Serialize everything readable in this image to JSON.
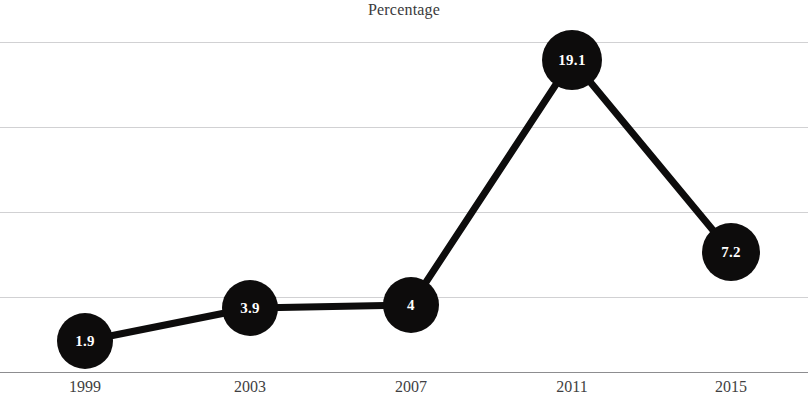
{
  "chart_data": {
    "type": "line",
    "title": "Percentage",
    "xlabel": "",
    "ylabel": "",
    "categories": [
      "1999",
      "2003",
      "2007",
      "2011",
      "2015"
    ],
    "values": [
      1.9,
      3.9,
      4,
      19.1,
      7.2
    ],
    "point_labels": [
      "1.9",
      "3.9",
      "4",
      "19.1",
      "7.2"
    ],
    "series": [
      {
        "name": "Percentage",
        "values": [
          1.9,
          3.9,
          4,
          19.1,
          7.2
        ]
      }
    ],
    "ylim": [
      0,
      19.4
    ],
    "grid": true,
    "gridlines_count": 4,
    "legend": "none",
    "marker": "filled-circle",
    "marker_color": "#0d0c0c",
    "line_color": "#0d0c0c",
    "label_color": "#ffffff",
    "background_color": "#ffffff",
    "gridline_color": "#c9c9cb"
  },
  "chart": {
    "title": "Percentage",
    "points": [
      {
        "category": "1999",
        "label": "1.9",
        "value": 1.9,
        "cx": 85,
        "cy": 341,
        "r": 28
      },
      {
        "category": "2003",
        "label": "3.9",
        "value": 3.9,
        "cx": 250,
        "cy": 308,
        "r": 28
      },
      {
        "category": "2007",
        "label": "4",
        "value": 4,
        "cx": 411,
        "cy": 305,
        "r": 28
      },
      {
        "category": "2011",
        "label": "19.1",
        "value": 19.1,
        "cx": 572,
        "cy": 60,
        "r": 30
      },
      {
        "category": "2015",
        "label": "7.2",
        "value": 7.2,
        "cx": 731,
        "cy": 252,
        "r": 29
      }
    ],
    "gridlines": [
      42,
      127,
      212,
      297
    ],
    "axis_baseline_y": 372,
    "x_tick_labels": [
      {
        "text": "1999",
        "x": 85
      },
      {
        "text": "2003",
        "x": 250
      },
      {
        "text": "2007",
        "x": 411
      },
      {
        "text": "2011",
        "x": 572
      },
      {
        "text": "2015",
        "x": 731
      }
    ],
    "polyline_points": "85,341 250,308 411,305 572,60 731,252"
  }
}
